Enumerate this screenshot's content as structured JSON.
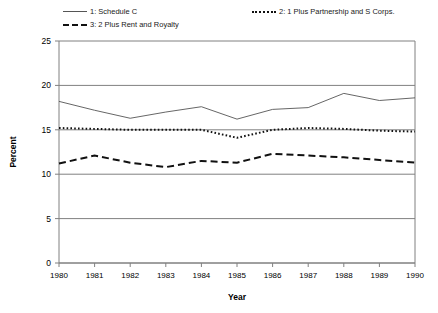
{
  "chart_data": {
    "type": "line",
    "title": "",
    "xlabel": "Year",
    "ylabel": "Percent",
    "x": [
      1980,
      1981,
      1982,
      1983,
      1984,
      1985,
      1986,
      1987,
      1988,
      1989,
      1990
    ],
    "xtick_labels": [
      "1980",
      "1981",
      "1982",
      "1983",
      "1984",
      "1985",
      "1986",
      "1987",
      "1988",
      "1989",
      "1990"
    ],
    "ytick_labels": [
      "0",
      "5",
      "10",
      "15",
      "20",
      "25"
    ],
    "ytick_values": [
      0,
      5,
      10,
      15,
      20,
      25
    ],
    "ylim": [
      0,
      25
    ],
    "xlim": [
      1980,
      1990
    ],
    "grid": "horizontal",
    "legend_position": "above-plot",
    "series": [
      {
        "name": "1: Schedule C",
        "style": "solid",
        "color": "#555555",
        "values": [
          18.2,
          17.2,
          16.3,
          17.0,
          17.6,
          16.2,
          17.3,
          17.5,
          19.1,
          18.3,
          18.6
        ]
      },
      {
        "name": "2: 1 Plus Partnership and S Corps.",
        "style": "dotted",
        "color": "#111111",
        "values": [
          15.2,
          15.1,
          15.0,
          15.0,
          15.0,
          14.1,
          15.0,
          15.2,
          15.1,
          14.9,
          14.8
        ]
      },
      {
        "name": "3: 2 Plus Rent and Royalty",
        "style": "dashed",
        "color": "#111111",
        "values": [
          11.2,
          12.1,
          11.3,
          10.8,
          11.5,
          11.3,
          12.3,
          12.1,
          11.9,
          11.6,
          11.3
        ]
      }
    ]
  },
  "legend": {
    "entries": [
      {
        "label": "1: Schedule C"
      },
      {
        "label": "2: 1 Plus Partnership and S Corps."
      },
      {
        "label": "3: 2 Plus Rent and Royalty"
      }
    ]
  }
}
